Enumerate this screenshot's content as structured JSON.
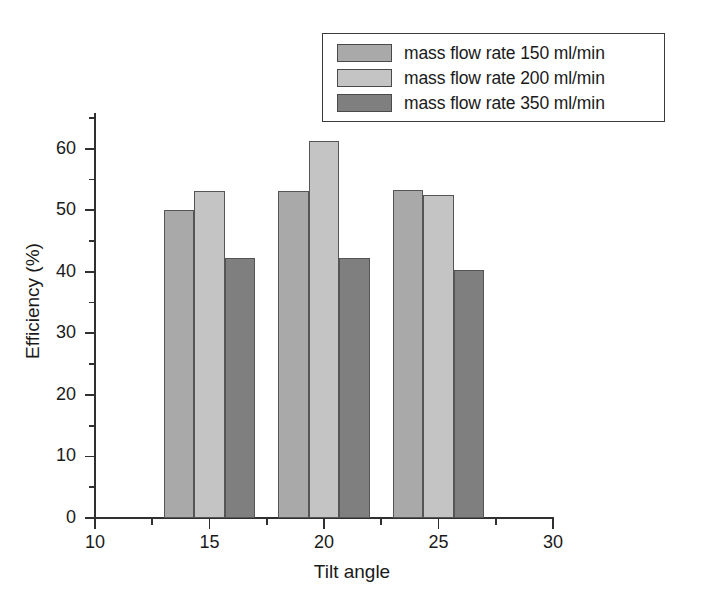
{
  "chart_data": {
    "type": "bar",
    "title": "",
    "subtitle": "",
    "xlabel": "Tilt angle",
    "ylabel": "Efficiency (%)",
    "categories": [
      15,
      20,
      25
    ],
    "category_labels": [
      "15",
      "20",
      "25"
    ],
    "series": [
      {
        "name": "mass flow rate 150 ml/min",
        "color": "#a9a9a9",
        "values": [
          50.1,
          53.2,
          53.3
        ]
      },
      {
        "name": "mass flow rate 200 ml/min",
        "color": "#c4c4c4",
        "values": [
          53.2,
          61.2,
          52.4
        ]
      },
      {
        "name": "mass flow rate 350 ml/min",
        "color": "#7f7f7f",
        "values": [
          42.2,
          42.3,
          40.3
        ]
      }
    ],
    "xlim": [
      10,
      30
    ],
    "ylim": [
      0,
      65.8
    ],
    "x_ticks": [
      10,
      15,
      20,
      25,
      30
    ],
    "x_tick_labels": [
      "10",
      "15",
      "20",
      "25",
      "30"
    ],
    "x_minor_ticks": [
      12.5,
      17.5,
      22.5,
      27.5
    ],
    "y_ticks": [
      0,
      10,
      20,
      30,
      40,
      50,
      60
    ],
    "y_tick_labels": [
      "0",
      "10",
      "20",
      "30",
      "40",
      "50",
      "60"
    ],
    "y_minor_ticks": [
      5,
      15,
      25,
      35,
      45,
      55,
      65
    ],
    "grid": false,
    "legend_position": "top-right",
    "bar_group_span": [
      [
        13,
        17
      ],
      [
        18,
        22
      ],
      [
        23,
        27
      ]
    ]
  },
  "legend": {
    "entries": [
      {
        "label": "mass flow rate 150 ml/min",
        "color": "#a9a9a9"
      },
      {
        "label": "mass flow rate 200 ml/min",
        "color": "#c4c4c4"
      },
      {
        "label": "mass flow rate 350 ml/min",
        "color": "#7f7f7f"
      }
    ]
  },
  "axes": {
    "x_title": "Tilt angle",
    "y_title": "Efficiency (%)"
  }
}
